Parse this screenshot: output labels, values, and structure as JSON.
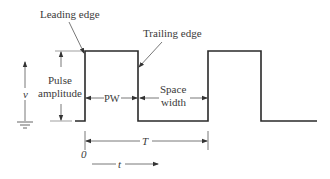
{
  "diagram": {
    "labels": {
      "leading_edge": "Leading edge",
      "trailing_edge": "Trailing edge",
      "pulse": "Pulse",
      "amplitude": "amplitude",
      "pw": "PW",
      "space": "Space",
      "width": "width",
      "period": "T",
      "voltage": "v",
      "time": "t",
      "origin": "0"
    },
    "colors": {
      "waveform": "#2a2a2a",
      "annotation": "#555555",
      "text": "#3a3a3a"
    }
  }
}
